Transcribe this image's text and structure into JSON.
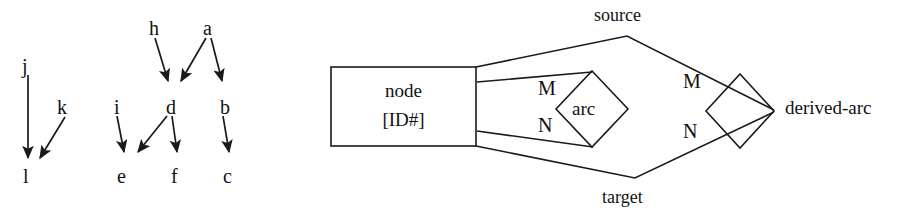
{
  "figure": {
    "width": 915,
    "height": 216,
    "background": "#ffffff",
    "stroke_color": "#1a1a1a",
    "text_color": "#111111",
    "panels": [
      {
        "id": "dag",
        "name": "directed-acyclic-graph-panel"
      },
      {
        "id": "er",
        "name": "entity-relationship-panel"
      }
    ]
  },
  "dag": {
    "nodes": [
      {
        "id": "j",
        "label": "j",
        "x": 22,
        "y": 56
      },
      {
        "id": "k",
        "label": "k",
        "x": 57,
        "y": 97
      },
      {
        "id": "l",
        "label": "l",
        "x": 23,
        "y": 166
      },
      {
        "id": "h",
        "label": "h",
        "x": 149,
        "y": 18
      },
      {
        "id": "a",
        "label": "a",
        "x": 203,
        "y": 18
      },
      {
        "id": "i",
        "label": "i",
        "x": 114,
        "y": 97
      },
      {
        "id": "d",
        "label": "d",
        "x": 166,
        "y": 97
      },
      {
        "id": "b",
        "label": "b",
        "x": 220,
        "y": 97
      },
      {
        "id": "e",
        "label": "e",
        "x": 117,
        "y": 166
      },
      {
        "id": "f",
        "label": "f",
        "x": 171,
        "y": 166
      },
      {
        "id": "c",
        "label": "c",
        "x": 223,
        "y": 166
      }
    ],
    "edges": [
      {
        "from": "j",
        "to": "l",
        "x1": 28,
        "y1": 75,
        "x2": 28,
        "y2": 158
      },
      {
        "from": "k",
        "to": "l",
        "x1": 65,
        "y1": 117,
        "x2": 40,
        "y2": 158
      },
      {
        "from": "h",
        "to": "d",
        "x1": 155,
        "y1": 38,
        "x2": 168,
        "y2": 81
      },
      {
        "from": "a",
        "to": "d",
        "x1": 206,
        "y1": 38,
        "x2": 181,
        "y2": 81
      },
      {
        "from": "a",
        "to": "b",
        "x1": 211,
        "y1": 38,
        "x2": 222,
        "y2": 81
      },
      {
        "from": "i",
        "to": "e",
        "x1": 117,
        "y1": 116,
        "x2": 124,
        "y2": 152
      },
      {
        "from": "d",
        "to": "e",
        "x1": 167,
        "y1": 116,
        "x2": 138,
        "y2": 152
      },
      {
        "from": "d",
        "to": "f",
        "x1": 172,
        "y1": 116,
        "x2": 177,
        "y2": 152
      },
      {
        "from": "b",
        "to": "c",
        "x1": 223,
        "y1": 116,
        "x2": 229,
        "y2": 152
      }
    ]
  },
  "er": {
    "entity": {
      "name": "node-entity",
      "lines": [
        "node",
        "[ID#]"
      ],
      "rect": {
        "x": 331,
        "y": 67,
        "width": 145,
        "height": 79
      }
    },
    "relationships": [
      {
        "id": "arc",
        "label": "arc",
        "diamond": {
          "cx": 592,
          "cy": 109,
          "rx": 36,
          "ry": 38
        },
        "label_x": 572,
        "label_y": 99
      },
      {
        "id": "derived-arc",
        "label": "derived-arc",
        "diamond": {
          "cx": 740,
          "cy": 111,
          "rx": 34,
          "ry": 37
        },
        "label_x": 785,
        "label_y": 98
      }
    ],
    "role_labels": [
      {
        "id": "source",
        "label": "source",
        "x": 594,
        "y": 6
      },
      {
        "id": "target",
        "label": "target",
        "x": 602,
        "y": 188
      }
    ],
    "cardinality_labels": [
      {
        "id": "arc-m",
        "label": "M",
        "x": 538,
        "y": 78
      },
      {
        "id": "arc-n",
        "label": "N",
        "x": 538,
        "y": 115
      },
      {
        "id": "derived-arc-m",
        "label": "M",
        "x": 683,
        "y": 71
      },
      {
        "id": "derived-arc-n",
        "label": "N",
        "x": 683,
        "y": 121
      }
    ],
    "connectors": [
      {
        "id": "entity-to-source-upper",
        "points": "476,67 627,36 774,110"
      },
      {
        "id": "entity-to-target-lower",
        "points": "476,146 635,178 774,112"
      },
      {
        "id": "entity-to-arc-top",
        "points": "477,82 592,72"
      },
      {
        "id": "entity-to-arc-bottom",
        "points": "477,131 593,147"
      }
    ]
  }
}
